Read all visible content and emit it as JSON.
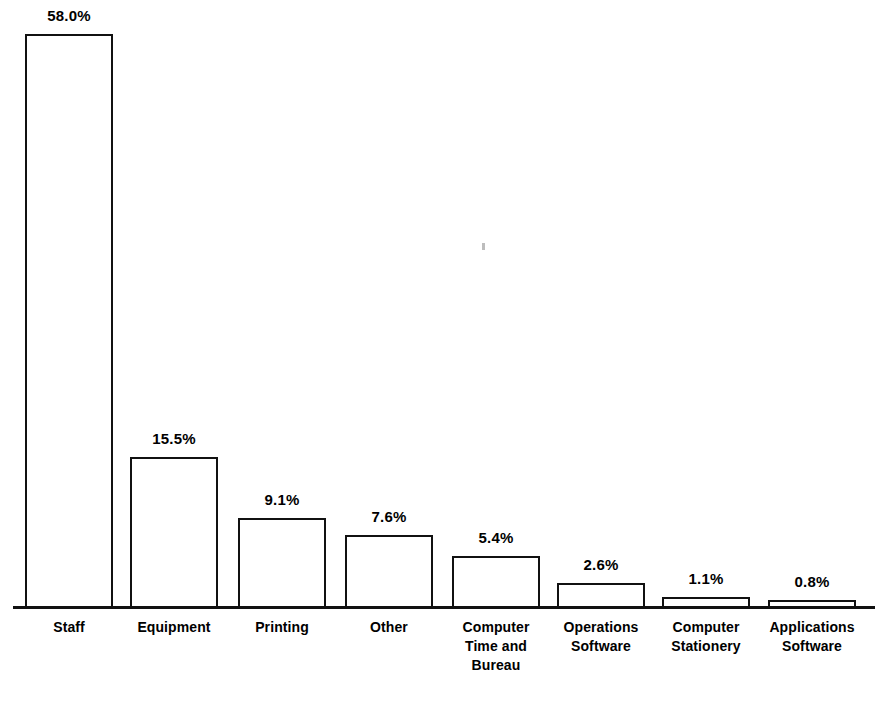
{
  "chart": {
    "background_color": "#ffffff",
    "bar_outline_color": "#111111",
    "bar_fill_color": "#ffffff",
    "axis_color": "#111111",
    "text_color": "#000000"
  },
  "chart_data": {
    "type": "bar",
    "title": "",
    "subtitle": "",
    "xlabel": "",
    "ylabel": "",
    "grid": false,
    "legend": "none",
    "ylim": [
      0,
      58
    ],
    "categories": [
      "Staff",
      "Equipment",
      "Printing",
      "Other",
      "Computer Time and Bureau",
      "Operations Software",
      "Computer Stationery",
      "Applications Software"
    ],
    "category_lines": [
      [
        "Staff"
      ],
      [
        "Equipment"
      ],
      [
        "Printing"
      ],
      [
        "Other"
      ],
      [
        "Computer",
        "Time and",
        "Bureau"
      ],
      [
        "Operations",
        "Software"
      ],
      [
        "Computer",
        "Stationery"
      ],
      [
        "Applications",
        "Software"
      ]
    ],
    "values": [
      58.0,
      15.5,
      9.1,
      7.6,
      5.4,
      2.6,
      1.1,
      0.8
    ],
    "value_labels": [
      "58.0%",
      "15.5%",
      "9.1%",
      "7.6%",
      "5.4%",
      "2.6%",
      "1.1%",
      "0.8%"
    ]
  },
  "bars": [
    {
      "name": "staff",
      "label": "58.0%",
      "lines": [
        "Staff"
      ],
      "left": 25,
      "width": 88,
      "height": 574,
      "label_left": 25,
      "label_width": 88,
      "label_top": 8,
      "tick_left": 5,
      "tick_width": 128
    },
    {
      "name": "equipment",
      "label": "15.5%",
      "lines": [
        "Equipment"
      ],
      "left": 130,
      "width": 88,
      "height": 151,
      "label_left": 130,
      "label_width": 88,
      "label_top": 431,
      "tick_left": 110,
      "tick_width": 128
    },
    {
      "name": "printing",
      "label": "9.1%",
      "lines": [
        "Printing"
      ],
      "left": 238,
      "width": 88,
      "height": 90,
      "label_left": 238,
      "label_width": 88,
      "label_top": 492,
      "tick_left": 218,
      "tick_width": 128
    },
    {
      "name": "other",
      "label": "7.6%",
      "lines": [
        "Other"
      ],
      "left": 345,
      "width": 88,
      "height": 73,
      "label_left": 345,
      "label_width": 88,
      "label_top": 509,
      "tick_left": 325,
      "tick_width": 128
    },
    {
      "name": "computer-time-and-bureau",
      "label": "5.4%",
      "lines": [
        "Computer",
        "Time and",
        "Bureau"
      ],
      "left": 452,
      "width": 88,
      "height": 52,
      "label_left": 452,
      "label_width": 88,
      "label_top": 530,
      "tick_left": 432,
      "tick_width": 128
    },
    {
      "name": "operations-software",
      "label": "2.6%",
      "lines": [
        "Operations",
        "Software"
      ],
      "left": 557,
      "width": 88,
      "height": 25,
      "label_left": 557,
      "label_width": 88,
      "label_top": 557,
      "tick_left": 537,
      "tick_width": 128
    },
    {
      "name": "computer-stationery",
      "label": "1.1%",
      "lines": [
        "Computer",
        "Stationery"
      ],
      "left": 662,
      "width": 88,
      "height": 11,
      "label_left": 662,
      "label_width": 88,
      "label_top": 571,
      "tick_left": 642,
      "tick_width": 128
    },
    {
      "name": "applications-software",
      "label": "0.8%",
      "lines": [
        "Applications",
        "Software"
      ],
      "left": 768,
      "width": 88,
      "height": 8,
      "label_left": 768,
      "label_width": 88,
      "label_top": 574,
      "tick_left": 748,
      "tick_width": 128
    }
  ]
}
